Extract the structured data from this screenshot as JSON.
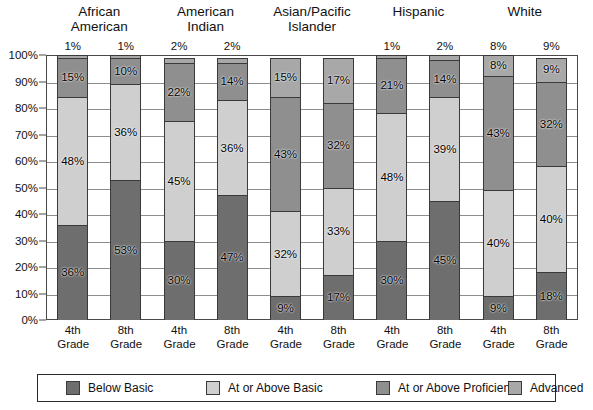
{
  "chart_data": {
    "type": "bar",
    "subtype": "stacked-percent",
    "title": "",
    "xlabel": "",
    "ylabel": "",
    "ylim": [
      0,
      100
    ],
    "ytick_labels": [
      "0%",
      "10%",
      "20%",
      "30%",
      "40%",
      "50%",
      "60%",
      "70%",
      "80%",
      "90%",
      "100%"
    ],
    "ytick_values": [
      0,
      10,
      20,
      30,
      40,
      50,
      60,
      70,
      80,
      90,
      100
    ],
    "grid": true,
    "legend_position": "bottom",
    "series": [
      {
        "name": "Below Basic",
        "color": "#6e6e6e"
      },
      {
        "name": "At or Above Basic",
        "color": "#cfcfcf"
      },
      {
        "name": "At or Above Proficient",
        "color": "#8f8f8f"
      },
      {
        "name": "Advanced",
        "color": "#a8a8a8"
      }
    ],
    "groups": [
      {
        "label_line1": "African",
        "label_line2": "American",
        "bars": [
          {
            "category": "4th Grade",
            "values": [
              36,
              48,
              15,
              1
            ],
            "labels": [
              "36%",
              "48%",
              "15%",
              "1%"
            ],
            "top_label": "1%"
          },
          {
            "category": "8th Grade",
            "values": [
              53,
              36,
              10,
              1
            ],
            "labels": [
              "53%",
              "36%",
              "10%",
              "1%"
            ],
            "top_label": "1%"
          }
        ]
      },
      {
        "label_line1": "American",
        "label_line2": "Indian",
        "bars": [
          {
            "category": "4th Grade",
            "values": [
              30,
              45,
              22,
              2
            ],
            "labels": [
              "30%",
              "45%",
              "22%",
              "2%"
            ],
            "top_label": "2%"
          },
          {
            "category": "8th Grade",
            "values": [
              47,
              36,
              14,
              2
            ],
            "labels": [
              "47%",
              "36%",
              "14%",
              "2%"
            ],
            "top_label": "2%"
          }
        ]
      },
      {
        "label_line1": "Asian/Pacific",
        "label_line2": "Islander",
        "bars": [
          {
            "category": "4th Grade",
            "values": [
              9,
              32,
              43,
              15
            ],
            "labels": [
              "9%",
              "32%",
              "43%",
              "15%"
            ],
            "top_label": ""
          },
          {
            "category": "8th Grade",
            "values": [
              17,
              33,
              32,
              17
            ],
            "labels": [
              "17%",
              "33%",
              "32%",
              "17%"
            ],
            "top_label": ""
          }
        ]
      },
      {
        "label_line1": "Hispanic",
        "label_line2": "",
        "bars": [
          {
            "category": "4th Grade",
            "values": [
              30,
              48,
              21,
              1
            ],
            "labels": [
              "30%",
              "48%",
              "21%",
              "1%"
            ],
            "top_label": "1%"
          },
          {
            "category": "8th Grade",
            "values": [
              45,
              39,
              14,
              2
            ],
            "labels": [
              "45%",
              "39%",
              "14%",
              "2%"
            ],
            "top_label": "2%"
          }
        ]
      },
      {
        "label_line1": "White",
        "label_line2": "",
        "bars": [
          {
            "category": "4th Grade",
            "values": [
              9,
              40,
              43,
              8
            ],
            "labels": [
              "9%",
              "40%",
              "43%",
              "8%"
            ],
            "top_label": "8%"
          },
          {
            "category": "8th Grade",
            "values": [
              18,
              40,
              32,
              9
            ],
            "labels": [
              "18%",
              "40%",
              "32%",
              "9%"
            ],
            "top_label": "9%"
          }
        ]
      }
    ]
  },
  "xaxis": {
    "tick_line1": "4th",
    "tick_line2": "Grade",
    "tick_line1_alt": "8th"
  },
  "legend": {
    "items": [
      {
        "label": "Below Basic",
        "color": "#6e6e6e"
      },
      {
        "label": "At or Above Basic",
        "color": "#cfcfcf"
      },
      {
        "label": "At or Above Proficient",
        "color": "#8f8f8f"
      },
      {
        "label": "Advanced",
        "color": "#a8a8a8"
      }
    ]
  }
}
